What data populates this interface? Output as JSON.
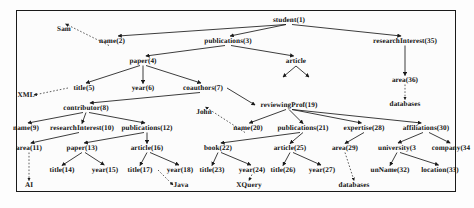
{
  "figure": {
    "type": "xml-data-tree-diagram",
    "border_color": "#1a1a1a",
    "edge_color": "#1a1a1a",
    "text_color": "#111111"
  },
  "nodes": [
    {
      "id": "n1",
      "label": "student(1)",
      "x": 289,
      "y": 20,
      "kind": "element"
    },
    {
      "id": "n2",
      "label": "name(2)",
      "x": 112,
      "y": 41,
      "kind": "element"
    },
    {
      "id": "n3",
      "label": "publications(3)",
      "x": 228,
      "y": 41,
      "kind": "element"
    },
    {
      "id": "n35",
      "label": "researchInterest(35)",
      "x": 405,
      "y": 41,
      "kind": "element"
    },
    {
      "id": "n4",
      "label": "paper(4)",
      "x": 143,
      "y": 61,
      "kind": "element"
    },
    {
      "id": "narticle",
      "label": "article",
      "x": 296,
      "y": 61,
      "kind": "element"
    },
    {
      "id": "n36",
      "label": "area(36)",
      "x": 405,
      "y": 80,
      "kind": "element"
    },
    {
      "id": "n5",
      "label": "title(5)",
      "x": 84,
      "y": 88,
      "kind": "element"
    },
    {
      "id": "n6",
      "label": "year(6)",
      "x": 143,
      "y": 88,
      "kind": "element"
    },
    {
      "id": "n7",
      "label": "coauthors(7)",
      "x": 203,
      "y": 88,
      "kind": "element"
    },
    {
      "id": "n8",
      "label": "contributor(8)",
      "x": 86,
      "y": 108,
      "kind": "element"
    },
    {
      "id": "n19",
      "label": "reviewingProf(19)",
      "x": 289,
      "y": 105,
      "kind": "element"
    },
    {
      "id": "n9",
      "label": "name(9)",
      "x": 26,
      "y": 128,
      "kind": "element"
    },
    {
      "id": "n10",
      "label": "researchInterest(10)",
      "x": 82,
      "y": 128,
      "kind": "element"
    },
    {
      "id": "n12",
      "label": "publications(12)",
      "x": 147,
      "y": 128,
      "kind": "element"
    },
    {
      "id": "n20",
      "label": "name(20)",
      "x": 248,
      "y": 128,
      "kind": "element"
    },
    {
      "id": "n21",
      "label": "publications(21)",
      "x": 303,
      "y": 128,
      "kind": "element"
    },
    {
      "id": "n28",
      "label": "expertise(28)",
      "x": 364,
      "y": 128,
      "kind": "element"
    },
    {
      "id": "n30",
      "label": "affiliations(30)",
      "x": 426,
      "y": 128,
      "kind": "element"
    },
    {
      "id": "n11",
      "label": "area(11)",
      "x": 29,
      "y": 148,
      "kind": "element"
    },
    {
      "id": "n13",
      "label": "paper(13)",
      "x": 82,
      "y": 148,
      "kind": "element"
    },
    {
      "id": "n16",
      "label": "article(16)",
      "x": 147,
      "y": 148,
      "kind": "element"
    },
    {
      "id": "n22",
      "label": "book(22)",
      "x": 218,
      "y": 148,
      "kind": "element"
    },
    {
      "id": "n25",
      "label": "article(25)",
      "x": 290,
      "y": 148,
      "kind": "element"
    },
    {
      "id": "n29",
      "label": "area(29)",
      "x": 345,
      "y": 148,
      "kind": "element"
    },
    {
      "id": "n31",
      "label": "university(3",
      "x": 397,
      "y": 148,
      "kind": "element"
    },
    {
      "id": "n34",
      "label": "company(34",
      "x": 451,
      "y": 148,
      "kind": "element"
    },
    {
      "id": "n14",
      "label": "title(14)",
      "x": 62,
      "y": 170,
      "kind": "element"
    },
    {
      "id": "n15",
      "label": "year(15)",
      "x": 105,
      "y": 170,
      "kind": "element"
    },
    {
      "id": "n17",
      "label": "title(17)",
      "x": 140,
      "y": 170,
      "kind": "element"
    },
    {
      "id": "n18",
      "label": "year(18)",
      "x": 180,
      "y": 170,
      "kind": "element"
    },
    {
      "id": "n23",
      "label": "title(23)",
      "x": 212,
      "y": 170,
      "kind": "element"
    },
    {
      "id": "n24",
      "label": "year(24)",
      "x": 252,
      "y": 170,
      "kind": "element"
    },
    {
      "id": "n26",
      "label": "title(26)",
      "x": 283,
      "y": 170,
      "kind": "element"
    },
    {
      "id": "n27",
      "label": "year(27)",
      "x": 322,
      "y": 170,
      "kind": "element"
    },
    {
      "id": "n32",
      "label": "unName(32)",
      "x": 390,
      "y": 170,
      "kind": "element"
    },
    {
      "id": "n33",
      "label": "location(33)",
      "x": 440,
      "y": 170,
      "kind": "element"
    },
    {
      "id": "vSam",
      "label": "Sam",
      "x": 64,
      "y": 29,
      "kind": "value"
    },
    {
      "id": "vXML",
      "label": "XML",
      "x": 26,
      "y": 95,
      "kind": "value"
    },
    {
      "id": "vJohn",
      "label": "John",
      "x": 204,
      "y": 112,
      "kind": "value"
    },
    {
      "id": "vDatabases1",
      "label": "databases",
      "x": 405,
      "y": 104,
      "kind": "value"
    },
    {
      "id": "vAI",
      "label": "AI",
      "x": 29,
      "y": 185,
      "kind": "value"
    },
    {
      "id": "vJava",
      "label": "Java",
      "x": 181,
      "y": 185,
      "kind": "value"
    },
    {
      "id": "vXQuery",
      "label": "XQuery",
      "x": 249,
      "y": 185,
      "kind": "value"
    },
    {
      "id": "vDatabases2",
      "label": "databases",
      "x": 354,
      "y": 185,
      "kind": "value"
    }
  ],
  "edges": [
    {
      "from": "n1",
      "to": "n2",
      "style": "solid"
    },
    {
      "from": "n1",
      "to": "n3",
      "style": "solid"
    },
    {
      "from": "n1",
      "to": "n35",
      "style": "solid"
    },
    {
      "from": "n3",
      "to": "n4",
      "style": "solid"
    },
    {
      "from": "n3",
      "to": "narticle",
      "style": "solid"
    },
    {
      "from": "n4",
      "to": "n5",
      "style": "solid"
    },
    {
      "from": "n4",
      "to": "n6",
      "style": "solid"
    },
    {
      "from": "n4",
      "to": "n7",
      "style": "solid"
    },
    {
      "from": "n7",
      "to": "n8",
      "style": "solid"
    },
    {
      "from": "n7",
      "to": "n19",
      "style": "solid"
    },
    {
      "from": "n8",
      "to": "n9",
      "style": "solid"
    },
    {
      "from": "n8",
      "to": "n10",
      "style": "solid"
    },
    {
      "from": "n8",
      "to": "n12",
      "style": "solid"
    },
    {
      "from": "n10",
      "to": "n11",
      "style": "solid"
    },
    {
      "from": "n12",
      "to": "n13",
      "style": "solid"
    },
    {
      "from": "n12",
      "to": "n16",
      "style": "solid"
    },
    {
      "from": "n13",
      "to": "n14",
      "style": "solid"
    },
    {
      "from": "n13",
      "to": "n15",
      "style": "solid"
    },
    {
      "from": "n16",
      "to": "n17",
      "style": "solid"
    },
    {
      "from": "n16",
      "to": "n18",
      "style": "solid"
    },
    {
      "from": "n19",
      "to": "n20",
      "style": "solid"
    },
    {
      "from": "n19",
      "to": "n21",
      "style": "solid"
    },
    {
      "from": "n19",
      "to": "n28",
      "style": "solid"
    },
    {
      "from": "n19",
      "to": "n30",
      "style": "solid"
    },
    {
      "from": "n21",
      "to": "n22",
      "style": "solid"
    },
    {
      "from": "n21",
      "to": "n25",
      "style": "solid"
    },
    {
      "from": "n22",
      "to": "n23",
      "style": "solid"
    },
    {
      "from": "n22",
      "to": "n24",
      "style": "solid"
    },
    {
      "from": "n25",
      "to": "n26",
      "style": "solid"
    },
    {
      "from": "n25",
      "to": "n27",
      "style": "solid"
    },
    {
      "from": "n28",
      "to": "n29",
      "style": "solid"
    },
    {
      "from": "n30",
      "to": "n31",
      "style": "solid"
    },
    {
      "from": "n30",
      "to": "n34",
      "style": "solid"
    },
    {
      "from": "n31",
      "to": "n32",
      "style": "solid"
    },
    {
      "from": "n31",
      "to": "n33",
      "style": "solid"
    },
    {
      "from": "n35",
      "to": "n36",
      "style": "solid"
    },
    {
      "from": "n2",
      "to": "vSam",
      "style": "dashed"
    },
    {
      "from": "n5",
      "to": "vXML",
      "style": "dashed"
    },
    {
      "from": "n20",
      "to": "vJohn",
      "style": "dashed"
    },
    {
      "from": "n36",
      "to": "vDatabases1",
      "style": "dashed"
    },
    {
      "from": "n11",
      "to": "vAI",
      "style": "dashed"
    },
    {
      "from": "n17",
      "to": "vJava",
      "style": "dashed"
    },
    {
      "from": "n24",
      "to": "vXQuery",
      "style": "dashed"
    },
    {
      "from": "n29",
      "to": "vDatabases2",
      "style": "dashed"
    }
  ]
}
